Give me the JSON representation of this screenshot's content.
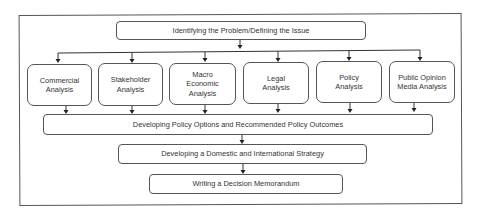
{
  "diagram": {
    "type": "flowchart",
    "top_step": {
      "label": "Identifying the Problem/Defining the Issue"
    },
    "analyses": [
      {
        "label": "Commercial Analysis"
      },
      {
        "label": "Stakeholder Analysis"
      },
      {
        "label": "Macro Economic Analysis"
      },
      {
        "label": "Legal Analysis"
      },
      {
        "label": "Policy Analysis"
      },
      {
        "label": "Public Opinion Media Analysis"
      }
    ],
    "policy_options": {
      "label": "Developing Policy Options and Recommended Policy Outcomes"
    },
    "strategy": {
      "label": "Developing a Domestic and International Strategy"
    },
    "memorandum": {
      "label": "Writing a Decision Memorandum"
    },
    "colors": {
      "border": "#555555",
      "text": "#333333",
      "background": "#ffffff"
    }
  }
}
